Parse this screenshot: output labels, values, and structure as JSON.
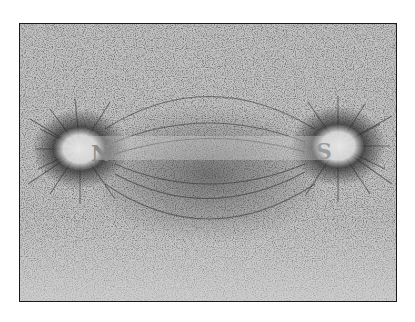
{
  "image": {
    "subject": "Iron filings pattern around a bar magnet",
    "background_color": "#ffffff",
    "frame_border_color": "#1a1a1a",
    "filings_base_color": "#c4c4c4",
    "filings_dark_color": "#2a2a2a"
  },
  "poles": {
    "north": {
      "label": "N"
    },
    "south": {
      "label": "S"
    }
  }
}
